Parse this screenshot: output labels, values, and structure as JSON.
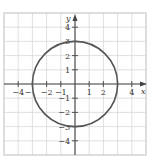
{
  "chart_data": {
    "type": "line",
    "title": "",
    "xlabel": "x",
    "ylabel": "y",
    "xlim": [
      -5,
      5
    ],
    "ylim": [
      -5,
      5
    ],
    "grid": true,
    "x_ticks": [
      -4,
      -3,
      -2,
      -1,
      1,
      2,
      3,
      4
    ],
    "x_tick_labels": [
      "−4",
      "−3",
      "−2",
      "−1",
      "1",
      "2",
      "3",
      "4"
    ],
    "y_ticks": [
      4,
      3,
      2,
      1,
      -1,
      -2,
      -3,
      -4
    ],
    "y_tick_labels": [
      "4",
      "3",
      "2",
      "1",
      "−1",
      "−2",
      "−3",
      "−4"
    ],
    "series": [
      {
        "name": "circle",
        "shape": "circle",
        "center": [
          0,
          0
        ],
        "radius": 3,
        "color": "#555555"
      }
    ]
  },
  "colors": {
    "grid": "#d8d8d8",
    "axis": "#444444",
    "curve": "#555555",
    "text": "#333333"
  }
}
